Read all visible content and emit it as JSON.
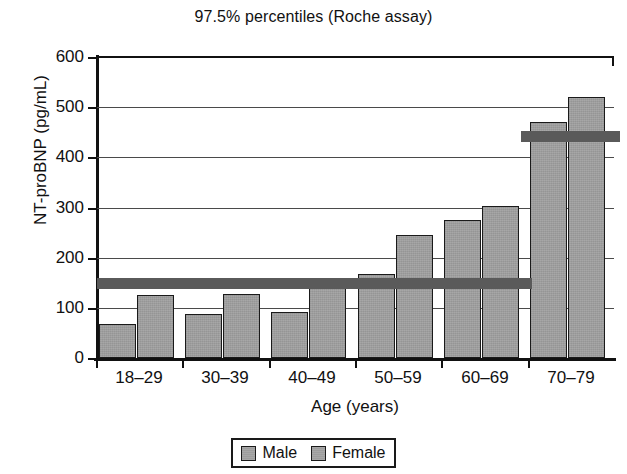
{
  "chart_data": {
    "type": "bar",
    "title": "97.5% percentiles (Roche assay)",
    "subtitle": "",
    "xlabel": "Age (years)",
    "ylabel": "NT-proBNP (pg/mL)",
    "categories": [
      "18–29",
      "30–39",
      "40–49",
      "50–59",
      "60–69",
      "70–79"
    ],
    "series": [
      {
        "name": "Male",
        "values": [
          67,
          88,
          92,
          167,
          276,
          470
        ],
        "color": "#9d9d9d"
      },
      {
        "name": "Female",
        "values": [
          125,
          128,
          150,
          245,
          303,
          520
        ],
        "color": "#9d9d9d"
      }
    ],
    "ylim": [
      0,
      600
    ],
    "yticks": [
      0,
      100,
      200,
      300,
      400,
      500,
      600
    ],
    "ytick_labels": [
      "0",
      "100",
      "200",
      "300",
      "400",
      "500",
      "600"
    ],
    "grid": true,
    "grid_axis": "y",
    "legend_position": "below-center",
    "annotations": [
      {
        "name": "reference-band-younger",
        "type": "horizontal-band",
        "value": 150,
        "from_category": "18–29",
        "to_category": "60–69",
        "color": "#5a5a5a"
      },
      {
        "name": "reference-band-older",
        "type": "horizontal-band",
        "value": 443,
        "from_category": "70–79",
        "to_category": "70–79",
        "color": "#5a5a5a"
      }
    ]
  },
  "legend": {
    "items": [
      {
        "label": "Male"
      },
      {
        "label": "Female"
      }
    ]
  }
}
